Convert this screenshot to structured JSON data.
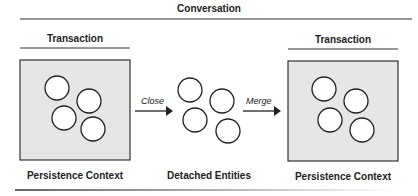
{
  "title": "Conversation",
  "left": {
    "header": "Transaction",
    "caption": "Persistence Context"
  },
  "middle": {
    "caption": "Detached Entities"
  },
  "right": {
    "header": "Transaction",
    "caption": "Persistence Context"
  },
  "arrows": {
    "close": "Close",
    "merge": "Merge"
  },
  "colors": {
    "box_fill": "#e6e6e6",
    "line": "#222222"
  }
}
